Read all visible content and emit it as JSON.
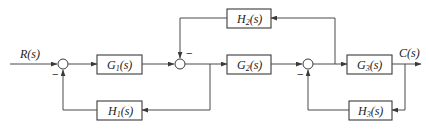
{
  "diagram": {
    "type": "block-diagram",
    "input": {
      "label": "R(s)"
    },
    "output": {
      "label": "C(s)"
    },
    "blocks": [
      {
        "id": "G1",
        "name": "G",
        "sub": "1",
        "suffix": "(s)"
      },
      {
        "id": "G2",
        "name": "G",
        "sub": "2",
        "suffix": "(s)"
      },
      {
        "id": "G3",
        "name": "G",
        "sub": "3",
        "suffix": "(s)"
      },
      {
        "id": "H1",
        "name": "H",
        "sub": "1",
        "suffix": "(s)"
      },
      {
        "id": "H2",
        "name": "H",
        "sub": "2",
        "suffix": "(s)"
      },
      {
        "id": "H3",
        "name": "H",
        "sub": "3",
        "suffix": "(s)"
      }
    ],
    "summing_junctions": [
      {
        "id": "S1",
        "inputs": [
          "R(s)",
          "H1 feedback"
        ],
        "sign_feedback": "−"
      },
      {
        "id": "S2",
        "inputs": [
          "G1 output",
          "H2 feedback"
        ],
        "sign_feedback": "−"
      },
      {
        "id": "S3",
        "inputs": [
          "G2 output",
          "H3 feedback"
        ],
        "sign_feedback": "−"
      }
    ],
    "connections": [
      "R(s) → S1",
      "S1 → G1",
      "G1 → S2",
      "S2 → G2",
      "S2 output → H1 → S1 (−)",
      "G2 → S3",
      "S3 → G3",
      "S3 output → H2 → S2 (−)",
      "G3 → C(s)",
      "C(s) → H3 → S3 (−)"
    ],
    "signs": {
      "minus": "−"
    }
  }
}
